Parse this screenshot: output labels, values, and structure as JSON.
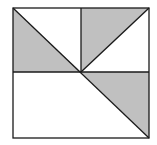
{
  "diagram": {
    "colors": {
      "shade": "#c0c0c0",
      "stroke": "#1a1a1a",
      "background": "#ffffff"
    },
    "square": {
      "x1": 13,
      "y1": 8,
      "x2": 149,
      "y2": 138
    },
    "center": {
      "x": 81,
      "y": 72
    },
    "shaded_triangles": [
      {
        "name": "top-left",
        "points": "13,8 13,72 81,72"
      },
      {
        "name": "top-right",
        "points": "81,8 149,8 81,72"
      },
      {
        "name": "bottom-right",
        "points": "81,72 149,72 149,138"
      }
    ]
  }
}
